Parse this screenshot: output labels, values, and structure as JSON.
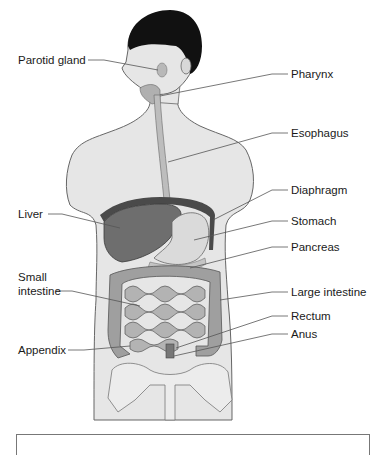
{
  "figure": {
    "labels_left": [
      {
        "id": "parotid",
        "text": "Parotid gland"
      },
      {
        "id": "liver",
        "text": "Liver"
      },
      {
        "id": "small1",
        "text": "Small"
      },
      {
        "id": "small2",
        "text": "intestine"
      },
      {
        "id": "appendix",
        "text": "Appendix"
      }
    ],
    "labels_right": [
      {
        "id": "pharynx",
        "text": "Pharynx"
      },
      {
        "id": "esophagus",
        "text": "Esophagus"
      },
      {
        "id": "diaphragm",
        "text": "Diaphragm"
      },
      {
        "id": "stomach",
        "text": "Stomach"
      },
      {
        "id": "pancreas",
        "text": "Pancreas"
      },
      {
        "id": "large",
        "text": "Large intestine"
      },
      {
        "id": "rectum",
        "text": "Rectum"
      },
      {
        "id": "anus",
        "text": "Anus"
      }
    ]
  },
  "colors": {
    "skin": "#e4e4e4",
    "outline": "#555555",
    "hair": "#111111",
    "liver": "#6e6e6e",
    "stomach": "#d9d9d9",
    "intestine": "#a9a9a9",
    "leader": "#555555"
  }
}
